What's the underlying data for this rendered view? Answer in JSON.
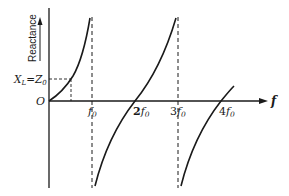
{
  "diagram": {
    "y_axis_label": "Reactance",
    "x_axis_label": "f",
    "origin_label": "O",
    "reference_level_label": "X_L = Z_0",
    "reference_level_label_parts": {
      "x": "X",
      "x_sub": "L",
      "eq": "=",
      "z": "Z",
      "z_sub": "0"
    },
    "tick_labels": [
      {
        "id": "f0",
        "coef": "",
        "sym": "f",
        "sub": "0"
      },
      {
        "id": "2f0",
        "coef": "2",
        "sym": "f",
        "sub": "0"
      },
      {
        "id": "3f0",
        "coef": "3",
        "sym": "f",
        "sub": "0"
      },
      {
        "id": "4f0",
        "coef": "4",
        "sym": "f",
        "sub": "0"
      }
    ],
    "asymptotes_at": [
      "f0",
      "3f0"
    ],
    "zero_crossings_at": [
      "0",
      "2f0",
      "4f0"
    ],
    "colors": {
      "ink": "#1a1a1a",
      "background": "#ffffff"
    }
  }
}
